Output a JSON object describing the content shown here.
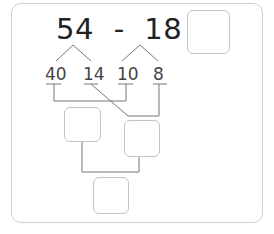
{
  "problem": {
    "left_operand": "54",
    "operator": "-",
    "right_operand": "18",
    "equals": "=",
    "expression": "54 - 18 ="
  },
  "decomposition": {
    "parts": [
      "40",
      "14",
      "10",
      "8"
    ]
  },
  "answer_boxes": {
    "result": "",
    "step1": "",
    "step2": "",
    "final": ""
  },
  "colors": {
    "text": "#222222",
    "line": "#666666",
    "box_border": "#c4c4c4",
    "card_border": "#cfcfcf"
  }
}
